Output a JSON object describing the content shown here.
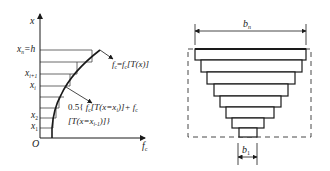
{
  "left_diagram": {
    "axis_y_label": "x",
    "axis_x_label_main": "f",
    "axis_x_label_sub": "c",
    "origin_label": "O",
    "ticks": [
      {
        "main": "x",
        "sub": "n",
        "suffix": "=h",
        "y": 50
      },
      {
        "main": "x",
        "sub": "i+1",
        "suffix": "",
        "y": 74
      },
      {
        "main": "x",
        "sub": "i",
        "suffix": "",
        "y": 86
      },
      {
        "main": "x",
        "sub": "2",
        "suffix": "",
        "y": 118
      },
      {
        "main": "x",
        "sub": "1",
        "suffix": "",
        "y": 128
      }
    ],
    "curve_label": "f_c = f_c[T(x)]",
    "curve_label_parts": {
      "a": "f",
      "a_sub": "c",
      "eq": "=",
      "b": "f",
      "b_sub": "c",
      "rest": "[T(x)]"
    },
    "avg_label_line1": "0.5{ f_c[T(x=x_i)]+ f_c",
    "avg_label_line2": "[T(x=x_{i-1})]}",
    "avg_label_parts": {
      "l1_prefix": "0.5{ ",
      "l1_f": "f",
      "l1_fsub": "c",
      "l1_mid": "[T(x=x",
      "l1_isub": "i",
      "l1_end": ")]+ ",
      "l1_f2": "f",
      "l1_f2sub": "c",
      "l2_start": "[T(x=x",
      "l2_sub": "i-1",
      "l2_end": ")]}"
    }
  },
  "right_diagram": {
    "top_dimension_main": "b",
    "top_dimension_sub": "n",
    "bottom_dimension_main": "b",
    "bottom_dimension_sub": "1",
    "step_count": 8
  },
  "colors": {
    "line": "#1a1a1a",
    "grid": "#444444",
    "background": "#ffffff"
  }
}
